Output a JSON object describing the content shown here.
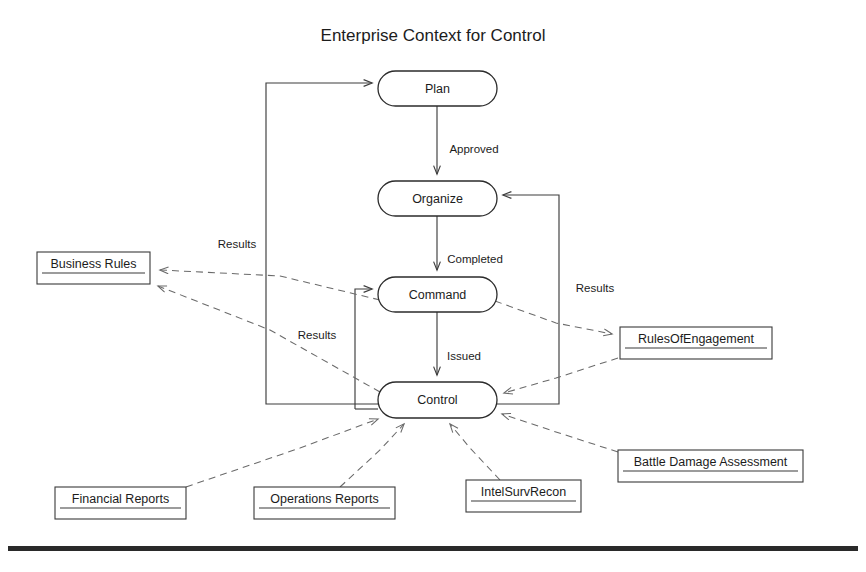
{
  "document": {
    "title": "Enterprise Context for Control",
    "title_position": {
      "x": 433,
      "y": 41
    }
  },
  "colors": {
    "background": "#ffffff",
    "node_stroke": "#2b2b2b",
    "object_stroke": "#3a3a3a",
    "flow_stroke": "#3d3d3d",
    "dependency_stroke": "#6a6a6a",
    "text": "#1c1c1c",
    "footer_rule": "#2a2a2a"
  },
  "activities": [
    {
      "id": "plan",
      "label": "Plan",
      "x": 378,
      "y": 71,
      "w": 119,
      "h": 35
    },
    {
      "id": "organize",
      "label": "Organize",
      "x": 378,
      "y": 181,
      "w": 119,
      "h": 35
    },
    {
      "id": "command",
      "label": "Command",
      "x": 378,
      "y": 277,
      "w": 119,
      "h": 35
    },
    {
      "id": "control",
      "label": "Control",
      "x": 378,
      "y": 382,
      "w": 119,
      "h": 36
    }
  ],
  "objects": [
    {
      "id": "business-rules",
      "label": "Business Rules",
      "x": 37,
      "y": 252,
      "w": 113,
      "h": 32
    },
    {
      "id": "rules-engagement",
      "label": "RulesOfEngagement",
      "x": 620,
      "y": 327,
      "w": 152,
      "h": 32
    },
    {
      "id": "financial",
      "label": "Financial Reports",
      "x": 55,
      "y": 487,
      "w": 131,
      "h": 32
    },
    {
      "id": "operations",
      "label": "Operations Reports",
      "x": 254,
      "y": 487,
      "w": 141,
      "h": 32
    },
    {
      "id": "intel",
      "label": "IntelSurvRecon",
      "x": 466,
      "y": 480,
      "w": 115,
      "h": 32
    },
    {
      "id": "battle-damage",
      "label": "Battle Damage Assessment",
      "x": 618,
      "y": 450,
      "w": 185,
      "h": 32
    }
  ],
  "transitions": [
    {
      "id": "plan-organize",
      "label": "Approved",
      "from": "plan",
      "to": "organize",
      "label_x": 474,
      "label_y": 150
    },
    {
      "id": "organize-command",
      "label": "Completed",
      "from": "organize",
      "to": "command",
      "label_x": 475,
      "label_y": 260
    },
    {
      "id": "command-control",
      "label": "Issued",
      "from": "command",
      "to": "control",
      "label_x": 464,
      "label_y": 357
    }
  ],
  "feedback": [
    {
      "id": "control-to-plan",
      "label": "Results",
      "label_x": 237,
      "label_y": 245,
      "note": "Control left side routed far left then up to Plan left entry"
    },
    {
      "id": "control-to-command",
      "label": "Results",
      "label_x": 317,
      "label_y": 336,
      "note": "Control left side routed up to Command left entry"
    },
    {
      "id": "control-to-organize",
      "label": "Results",
      "label_x": 595,
      "label_y": 289,
      "note": "Control right side routed up to Organize right entry"
    }
  ],
  "dependencies": [
    {
      "id": "command-to-business-rules",
      "from": "command",
      "to": "business-rules",
      "arrow_at": "business-rules"
    },
    {
      "id": "control-to-business-rules",
      "from": "control",
      "to": "business-rules",
      "arrow_at": "business-rules"
    },
    {
      "id": "command-to-roe",
      "from": "command",
      "to": "rules-engagement",
      "arrow_at": "rules-engagement"
    },
    {
      "id": "roe-to-control",
      "from": "rules-engagement",
      "to": "control",
      "arrow_at": "control"
    },
    {
      "id": "financial-to-control",
      "from": "financial",
      "to": "control",
      "arrow_at": "control"
    },
    {
      "id": "operations-to-control",
      "from": "operations",
      "to": "control",
      "arrow_at": "control"
    },
    {
      "id": "intel-to-control",
      "from": "intel",
      "to": "control",
      "arrow_at": "control"
    },
    {
      "id": "battle-damage-to-control",
      "from": "battle-damage",
      "to": "control",
      "arrow_at": "control"
    }
  ],
  "footer": {
    "rule_y": 546,
    "rule_height": 5,
    "rule_x": 8,
    "rule_width": 850
  }
}
